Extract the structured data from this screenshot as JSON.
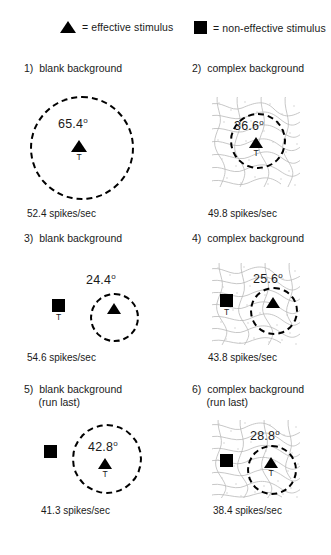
{
  "legend": {
    "effective": {
      "icon": "triangle-icon",
      "text": "= effective stimulus"
    },
    "non_effective": {
      "icon": "square-icon",
      "text": "= non-effective stimulus"
    }
  },
  "panels": [
    {
      "id": 1,
      "title": "1)  blank background",
      "background": "blank",
      "angle": "65.4",
      "degree_symbol": "o",
      "rate": "52.4 spikes/sec",
      "target_label": "T",
      "target_on": "triangle",
      "has_square": false
    },
    {
      "id": 2,
      "title": "2)  complex background",
      "background": "complex",
      "angle": "36.6",
      "degree_symbol": "o",
      "rate": "49.8 spikes/sec",
      "target_label": "T",
      "target_on": "triangle",
      "has_square": false
    },
    {
      "id": 3,
      "title": "3)  blank background",
      "background": "blank",
      "angle": "24.4",
      "degree_symbol": "o",
      "rate": "54.6 spikes/sec",
      "target_label": "T",
      "target_on": "square",
      "has_square": true
    },
    {
      "id": 4,
      "title": "4)  complex background",
      "background": "complex",
      "angle": "25.6",
      "degree_symbol": "o",
      "rate": "43.8 spikes/sec",
      "target_label": "T",
      "target_on": "square",
      "has_square": true
    },
    {
      "id": 5,
      "title": "5)  blank background\n     (run last)",
      "background": "blank",
      "angle": "42.8",
      "degree_symbol": "o",
      "rate": "41.3 spikes/sec",
      "target_label": "T",
      "target_on": "triangle",
      "has_square": true
    },
    {
      "id": 6,
      "title": "6)  complex background\n     (run last)",
      "background": "complex",
      "angle": "28.8",
      "degree_symbol": "o",
      "rate": "38.4 spikes/sec",
      "target_label": "T",
      "target_on": "triangle",
      "has_square": true
    }
  ],
  "colors": {
    "ink": "#1a1a1a",
    "stimulus": "#000000",
    "receptive_field": "#000000",
    "texture": "#b9b9b9"
  }
}
